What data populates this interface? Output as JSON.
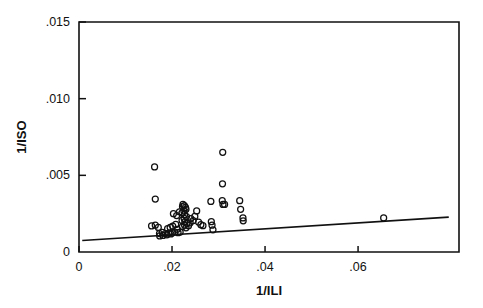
{
  "figure": {
    "name": "scatterplot-1ISO-vs-1ILI",
    "background": "#ffffff",
    "foreground": "#111111"
  },
  "chart_data": {
    "type": "scatter",
    "title": "",
    "subtitle": "",
    "xlabel": "1/ILI",
    "ylabel": "1/ISO",
    "xlim": [
      0.0,
      0.0817
    ],
    "ylim": [
      0.0,
      0.015
    ],
    "xticks": [
      0,
      0.02,
      0.04,
      0.06
    ],
    "xtick_labels": [
      "0",
      ".02",
      ".04",
      ".06"
    ],
    "yticks": [
      0,
      0.005,
      0.01,
      0.015
    ],
    "ytick_labels": [
      "0",
      ".005",
      ".010",
      ".015"
    ],
    "grid": false,
    "legend": null,
    "marker": "open-circle",
    "marker_size_px": 3.0,
    "series": [
      {
        "name": "observations",
        "marker": "open-circle",
        "points": [
          [
            0.01625,
            0.00555
          ],
          [
            0.0164,
            0.00345
          ],
          [
            0.01705,
            0.0016
          ],
          [
            0.0164,
            0.00175
          ],
          [
            0.0156,
            0.0017
          ],
          [
            0.0173,
            0.0012
          ],
          [
            0.0179,
            0.00128
          ],
          [
            0.01855,
            0.0012
          ],
          [
            0.0189,
            0.00112
          ],
          [
            0.01805,
            0.00108
          ],
          [
            0.01735,
            0.00105
          ],
          [
            0.0193,
            0.00123
          ],
          [
            0.01975,
            0.00118
          ],
          [
            0.0201,
            0.00125
          ],
          [
            0.0206,
            0.0013
          ],
          [
            0.01905,
            0.00152
          ],
          [
            0.0196,
            0.0016
          ],
          [
            0.02015,
            0.00168
          ],
          [
            0.0208,
            0.0018
          ],
          [
            0.0211,
            0.00148
          ],
          [
            0.0213,
            0.00126
          ],
          [
            0.02175,
            0.0013
          ],
          [
            0.0203,
            0.0025
          ],
          [
            0.021,
            0.00238
          ],
          [
            0.0216,
            0.00262
          ],
          [
            0.02225,
            0.00296
          ],
          [
            0.02235,
            0.0031
          ],
          [
            0.02265,
            0.00303
          ],
          [
            0.0229,
            0.00291
          ],
          [
            0.023,
            0.00278
          ],
          [
            0.02255,
            0.00268
          ],
          [
            0.02215,
            0.00255
          ],
          [
            0.0227,
            0.00243
          ],
          [
            0.0231,
            0.00231
          ],
          [
            0.0226,
            0.00219
          ],
          [
            0.02215,
            0.00206
          ],
          [
            0.02275,
            0.00196
          ],
          [
            0.0232,
            0.00186
          ],
          [
            0.0227,
            0.00175
          ],
          [
            0.02225,
            0.00166
          ],
          [
            0.023,
            0.00158
          ],
          [
            0.02355,
            0.00172
          ],
          [
            0.0239,
            0.0019
          ],
          [
            0.02405,
            0.00218
          ],
          [
            0.02455,
            0.00205
          ],
          [
            0.0249,
            0.00232
          ],
          [
            0.0253,
            0.00268
          ],
          [
            0.0257,
            0.00195
          ],
          [
            0.0262,
            0.00178
          ],
          [
            0.02665,
            0.00172
          ],
          [
            0.02835,
            0.0033
          ],
          [
            0.02845,
            0.00198
          ],
          [
            0.0286,
            0.00175
          ],
          [
            0.0288,
            0.00145
          ],
          [
            0.0309,
            0.0065
          ],
          [
            0.03085,
            0.00445
          ],
          [
            0.0308,
            0.00335
          ],
          [
            0.03095,
            0.0031
          ],
          [
            0.0313,
            0.0031
          ],
          [
            0.03455,
            0.00335
          ],
          [
            0.03475,
            0.00278
          ],
          [
            0.03525,
            0.00222
          ],
          [
            0.0353,
            0.00203
          ],
          [
            0.0655,
            0.00222
          ]
        ]
      }
    ],
    "fit_line": {
      "name": "regression-line",
      "x_start": 0.0007,
      "y_start": 0.00075,
      "x_end": 0.0795,
      "y_end": 0.00228,
      "slope": 0.0194,
      "intercept": 0.00074
    }
  }
}
